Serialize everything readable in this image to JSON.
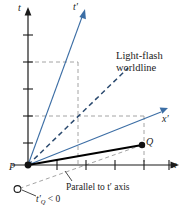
{
  "figure": {
    "type": "minkowski-spacetime-diagram",
    "width": 184,
    "height": 219,
    "background": "#ffffff"
  },
  "colors": {
    "axis": "#1b1b1b",
    "primed_axis": "#3c6ea5",
    "light_worldline": "#2b4a6f",
    "construction_dashed": "#9a9a9a",
    "segment_pq": "#000000",
    "text": "#1b1b1b"
  },
  "labels": {
    "t_axis": "t",
    "t_prime_axis": "t′",
    "x_axis": "x",
    "x_prime_axis": "x′",
    "point_p": "P",
    "point_q": "Q",
    "light_flash_line1": "Light-flash",
    "light_flash_line2": "worldline",
    "parallel_note": "Parallel to t′ axis",
    "tq_negative_main": "t",
    "tq_negative_sub": "Q",
    "tq_negative_rest": " < 0",
    "tq_negative_full": "t′Q < 0"
  },
  "geometry": {
    "origin": {
      "x": 28,
      "y": 165
    },
    "t_axis_top": {
      "x": 28,
      "y": 10
    },
    "x_axis_right": {
      "x": 176,
      "y": 165
    },
    "t_prime_tip": {
      "x": 84,
      "y": 11
    },
    "x_prime_tip": {
      "x": 166,
      "y": 108
    },
    "light_tip": {
      "x": 131,
      "y": 66
    },
    "point_q": {
      "x": 142,
      "y": 145
    },
    "open_circle": {
      "x": 17,
      "y": 189
    },
    "t_axis_ticks_y": [
      35,
      62,
      89,
      116,
      143
    ],
    "x_axis_ticks_x": [
      57,
      86,
      115,
      144,
      169
    ]
  },
  "elements": {
    "t_axis_name": "t-axis",
    "x_axis_name": "x-axis",
    "t_prime_axis_name": "t-prime-axis",
    "x_prime_axis_name": "x-prime-axis",
    "light_worldline_name": "light-flash-worldline",
    "segment_pq_name": "segment-p-to-q",
    "parallel_line_name": "parallel-to-t-prime-line",
    "projection_name": "projection-dashed-lines"
  }
}
